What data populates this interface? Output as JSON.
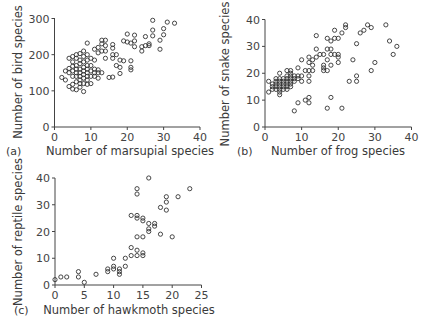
{
  "chart_data": [
    {
      "panel": "(a)",
      "type": "scatter",
      "title": "",
      "xlabel": "Number of marsupial species",
      "ylabel": "Number of bird species",
      "xlim": [
        0,
        40
      ],
      "ylim": [
        0,
        300
      ],
      "xticks": [
        0,
        10,
        20,
        30,
        40
      ],
      "yticks": [
        0,
        100,
        200,
        300
      ],
      "grid": false,
      "points": [
        [
          2,
          137
        ],
        [
          3,
          130
        ],
        [
          3,
          155
        ],
        [
          4,
          112
        ],
        [
          4,
          150
        ],
        [
          4,
          162
        ],
        [
          4,
          190
        ],
        [
          5,
          105
        ],
        [
          5,
          118
        ],
        [
          5,
          140
        ],
        [
          5,
          155
        ],
        [
          5,
          168
        ],
        [
          5,
          180
        ],
        [
          5,
          195
        ],
        [
          6,
          103
        ],
        [
          6,
          125
        ],
        [
          6,
          140
        ],
        [
          6,
          150
        ],
        [
          6,
          160
        ],
        [
          6,
          170
        ],
        [
          6,
          190
        ],
        [
          6,
          200
        ],
        [
          7,
          110
        ],
        [
          7,
          120
        ],
        [
          7,
          130
        ],
        [
          7,
          140
        ],
        [
          7,
          150
        ],
        [
          7,
          160
        ],
        [
          7,
          175
        ],
        [
          7,
          185
        ],
        [
          7,
          203
        ],
        [
          8,
          98
        ],
        [
          8,
          120
        ],
        [
          8,
          135
        ],
        [
          8,
          145
        ],
        [
          8,
          155
        ],
        [
          8,
          165
        ],
        [
          8,
          180
        ],
        [
          8,
          195
        ],
        [
          8,
          210
        ],
        [
          9,
          118
        ],
        [
          9,
          130
        ],
        [
          9,
          140
        ],
        [
          9,
          150
        ],
        [
          9,
          160
        ],
        [
          9,
          170
        ],
        [
          9,
          185
        ],
        [
          9,
          200
        ],
        [
          9,
          232
        ],
        [
          10,
          120
        ],
        [
          10,
          140
        ],
        [
          10,
          155
        ],
        [
          10,
          170
        ],
        [
          10,
          190
        ],
        [
          11,
          140
        ],
        [
          11,
          150
        ],
        [
          11,
          160
        ],
        [
          11,
          185
        ],
        [
          11,
          215
        ],
        [
          12,
          135
        ],
        [
          12,
          150
        ],
        [
          12,
          158
        ],
        [
          12,
          205
        ],
        [
          12,
          220
        ],
        [
          13,
          150
        ],
        [
          13,
          210
        ],
        [
          13,
          230
        ],
        [
          13,
          240
        ],
        [
          14,
          190
        ],
        [
          14,
          210
        ],
        [
          14,
          225
        ],
        [
          14,
          240
        ],
        [
          15,
          137
        ],
        [
          16,
          138
        ],
        [
          16,
          190
        ],
        [
          16,
          200
        ],
        [
          16,
          218
        ],
        [
          16,
          228
        ],
        [
          17,
          170
        ],
        [
          17,
          200
        ],
        [
          18,
          148
        ],
        [
          18,
          165
        ],
        [
          18,
          185
        ],
        [
          19,
          183
        ],
        [
          19,
          238
        ],
        [
          20,
          235
        ],
        [
          20,
          257
        ],
        [
          21,
          158
        ],
        [
          21,
          165
        ],
        [
          21,
          183
        ],
        [
          21,
          232
        ],
        [
          22,
          222
        ],
        [
          22,
          238
        ],
        [
          22,
          254
        ],
        [
          24,
          210
        ],
        [
          24,
          222
        ],
        [
          25,
          225
        ],
        [
          25,
          250
        ],
        [
          26,
          225
        ],
        [
          26,
          230
        ],
        [
          27,
          252
        ],
        [
          27,
          268
        ],
        [
          27,
          295
        ],
        [
          29,
          215
        ],
        [
          29,
          240
        ],
        [
          30,
          255
        ],
        [
          30,
          272
        ],
        [
          31,
          290
        ],
        [
          33,
          287
        ]
      ]
    },
    {
      "panel": "(b)",
      "type": "scatter",
      "title": "",
      "xlabel": "Number of frog species",
      "ylabel": "Number of snake species",
      "xlim": [
        0,
        40
      ],
      "ylim": [
        0,
        40
      ],
      "xticks": [
        0,
        10,
        20,
        30,
        40
      ],
      "yticks": [
        0,
        10,
        20,
        30,
        40
      ],
      "grid": false,
      "points": [
        [
          1,
          13
        ],
        [
          1,
          17
        ],
        [
          2,
          14
        ],
        [
          2,
          15
        ],
        [
          2,
          16
        ],
        [
          3,
          14
        ],
        [
          3,
          15
        ],
        [
          3,
          16
        ],
        [
          3,
          17
        ],
        [
          3,
          18
        ],
        [
          4,
          12
        ],
        [
          4,
          13
        ],
        [
          4,
          14
        ],
        [
          4,
          15
        ],
        [
          4,
          16
        ],
        [
          4,
          17
        ],
        [
          4,
          18
        ],
        [
          4,
          20
        ],
        [
          5,
          14
        ],
        [
          5,
          15
        ],
        [
          5,
          16
        ],
        [
          5,
          17
        ],
        [
          5,
          18
        ],
        [
          6,
          14
        ],
        [
          6,
          15
        ],
        [
          6,
          16
        ],
        [
          6,
          17
        ],
        [
          6,
          18
        ],
        [
          6,
          19
        ],
        [
          6,
          21
        ],
        [
          7,
          15
        ],
        [
          7,
          16
        ],
        [
          7,
          17
        ],
        [
          7,
          18
        ],
        [
          7,
          19
        ],
        [
          7,
          20
        ],
        [
          7,
          21
        ],
        [
          8,
          6
        ],
        [
          8,
          17
        ],
        [
          8,
          18
        ],
        [
          8,
          19
        ],
        [
          9,
          9
        ],
        [
          9,
          18
        ],
        [
          9,
          19
        ],
        [
          9,
          22
        ],
        [
          10,
          17
        ],
        [
          10,
          19
        ],
        [
          10,
          25
        ],
        [
          11,
          10
        ],
        [
          11,
          21
        ],
        [
          12,
          9
        ],
        [
          12,
          11
        ],
        [
          12,
          17
        ],
        [
          12,
          19
        ],
        [
          12,
          21
        ],
        [
          12,
          24
        ],
        [
          12,
          26
        ],
        [
          13,
          21
        ],
        [
          13,
          23
        ],
        [
          13,
          25
        ],
        [
          14,
          26
        ],
        [
          14,
          29
        ],
        [
          14,
          34
        ],
        [
          15,
          27
        ],
        [
          16,
          21
        ],
        [
          16,
          22
        ],
        [
          16,
          23
        ],
        [
          16,
          27
        ],
        [
          17,
          7
        ],
        [
          17,
          21
        ],
        [
          17,
          25
        ],
        [
          17,
          29
        ],
        [
          17,
          33
        ],
        [
          18,
          11
        ],
        [
          18,
          23
        ],
        [
          18,
          27
        ],
        [
          18,
          29
        ],
        [
          18,
          32
        ],
        [
          19,
          27
        ],
        [
          19,
          33
        ],
        [
          19,
          36
        ],
        [
          20,
          24
        ],
        [
          20,
          26
        ],
        [
          20,
          27
        ],
        [
          20,
          33
        ],
        [
          21,
          7
        ],
        [
          21,
          35
        ],
        [
          22,
          37
        ],
        [
          22,
          38
        ],
        [
          23,
          17
        ],
        [
          24,
          25
        ],
        [
          25,
          17
        ],
        [
          25,
          19
        ],
        [
          25,
          31
        ],
        [
          26,
          35
        ],
        [
          27,
          36
        ],
        [
          28,
          38
        ],
        [
          29,
          37
        ],
        [
          29,
          21
        ],
        [
          30,
          24
        ],
        [
          33,
          38
        ],
        [
          34,
          32
        ],
        [
          35,
          27
        ],
        [
          36,
          30
        ]
      ]
    },
    {
      "panel": "(c)",
      "type": "scatter",
      "title": "",
      "xlabel": "Number of hawkmoth species",
      "ylabel": "Number of reptile species",
      "xlim": [
        0,
        25
      ],
      "ylim": [
        0,
        40
      ],
      "xticks": [
        0,
        5,
        10,
        15,
        20,
        25
      ],
      "yticks": [
        0,
        10,
        20,
        30,
        40
      ],
      "grid": false,
      "points": [
        [
          0,
          2
        ],
        [
          1,
          3
        ],
        [
          2,
          3
        ],
        [
          4,
          3
        ],
        [
          4,
          5
        ],
        [
          5,
          1
        ],
        [
          7,
          4
        ],
        [
          9,
          5
        ],
        [
          9,
          6
        ],
        [
          10,
          6
        ],
        [
          10,
          7
        ],
        [
          10,
          10
        ],
        [
          11,
          4
        ],
        [
          11,
          5
        ],
        [
          11,
          6
        ],
        [
          12,
          7
        ],
        [
          12,
          10
        ],
        [
          13,
          11
        ],
        [
          13,
          14
        ],
        [
          13,
          26
        ],
        [
          14,
          11
        ],
        [
          14,
          13
        ],
        [
          14,
          18
        ],
        [
          14,
          25
        ],
        [
          14,
          26
        ],
        [
          14,
          34
        ],
        [
          14,
          36
        ],
        [
          15,
          11
        ],
        [
          15,
          12
        ],
        [
          15,
          18
        ],
        [
          15,
          24
        ],
        [
          15,
          25
        ],
        [
          16,
          20
        ],
        [
          16,
          21
        ],
        [
          16,
          23
        ],
        [
          16,
          40
        ],
        [
          17,
          22
        ],
        [
          17,
          23
        ],
        [
          18,
          19
        ],
        [
          18,
          29
        ],
        [
          19,
          28
        ],
        [
          19,
          31
        ],
        [
          19,
          33
        ],
        [
          20,
          18
        ],
        [
          21,
          33
        ],
        [
          23,
          36
        ]
      ]
    }
  ],
  "panels": {
    "a": {
      "label": "(a)",
      "xlabel": "Number of marsupial species",
      "ylabel": "Number of bird species",
      "xticks": [
        "0",
        "10",
        "20",
        "30",
        "40"
      ],
      "yticks": [
        "0",
        "100",
        "200",
        "300"
      ]
    },
    "b": {
      "label": "(b)",
      "xlabel": "Number of frog species",
      "ylabel": "Number of snake species",
      "xticks": [
        "0",
        "10",
        "20",
        "30",
        "40"
      ],
      "yticks": [
        "0",
        "10",
        "20",
        "30",
        "40"
      ]
    },
    "c": {
      "label": "(c)",
      "xlabel": "Number of hawkmoth species",
      "ylabel": "Number of reptile species",
      "xticks": [
        "0",
        "5",
        "10",
        "15",
        "20",
        "25"
      ],
      "yticks": [
        "0",
        "10",
        "20",
        "30",
        "40"
      ]
    }
  }
}
